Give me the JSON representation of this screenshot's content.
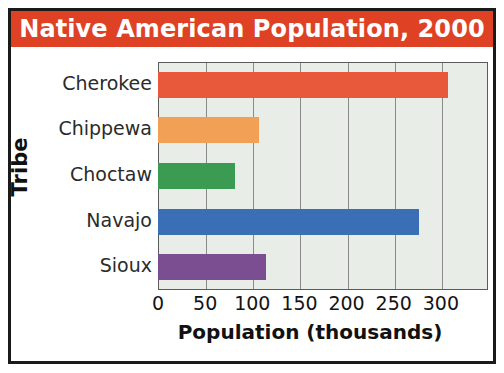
{
  "chart_data": {
    "type": "bar",
    "orientation": "horizontal",
    "title": "Native American Population, 2000",
    "categories": [
      "Cherokee",
      "Chippewa",
      "Choctaw",
      "Navajo",
      "Sioux"
    ],
    "values": [
      308,
      107,
      82,
      277,
      115
    ],
    "series": [
      {
        "name": "Population (thousands)",
        "values": [
          308,
          107,
          82,
          277,
          115
        ]
      }
    ],
    "bar_colors": [
      "#e8593c",
      "#f2a055",
      "#3b9b52",
      "#3a6fb5",
      "#7a4e90"
    ],
    "xlabel": "Population (thousands)",
    "ylabel": "Tribe",
    "xlim": [
      0,
      350
    ],
    "xticks": [
      0,
      50,
      100,
      150,
      200,
      250,
      300
    ],
    "xtick_labels": [
      "0",
      "50",
      "100",
      "150",
      "200",
      "250",
      "300"
    ],
    "grid": "vertical",
    "legend": "none",
    "plot_background": "#e8eee7",
    "title_banner_color": "#de4124",
    "title_text_color": "#ffffff"
  }
}
